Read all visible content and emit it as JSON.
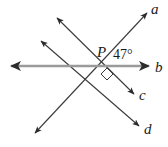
{
  "figure": {
    "background_color": "#ffffff",
    "width": 168,
    "height": 147
  },
  "point": {
    "label": "P",
    "x": 108,
    "y": 66
  },
  "angle": {
    "value": "47°",
    "degrees": 47,
    "between": [
      "a",
      "b"
    ],
    "label_x": 113,
    "label_y": 58
  },
  "right_angle": {
    "marker": "square",
    "degrees": 90,
    "x": 107,
    "y": 75
  },
  "lines": [
    {
      "id": "line-a",
      "label": "a",
      "color": "#3a3a3a",
      "stroke_width": 1.1,
      "x1": 35,
      "y1": 133,
      "x2": 147,
      "y2": 13,
      "arrow_start": true,
      "arrow_end": true,
      "label_x": 152,
      "label_y": 12
    },
    {
      "id": "line-b",
      "label": "b",
      "color": "#9a9a9a",
      "stroke_width": 2.4,
      "x1": 11,
      "y1": 66,
      "x2": 149,
      "y2": 66,
      "arrow_start": true,
      "arrow_end": true,
      "label_x": 156,
      "label_y": 71
    },
    {
      "id": "line-c",
      "label": "c",
      "color": "#3a3a3a",
      "stroke_width": 1.1,
      "x1": 57,
      "y1": 18,
      "x2": 134,
      "y2": 94,
      "arrow_start": true,
      "arrow_end": true,
      "label_x": 140,
      "label_y": 99
    },
    {
      "id": "line-d",
      "label": "d",
      "color": "#3a3a3a",
      "stroke_width": 1.1,
      "x1": 41,
      "y1": 41,
      "x2": 139,
      "y2": 126,
      "arrow_start": true,
      "arrow_end": true,
      "label_x": 145,
      "label_y": 133
    }
  ]
}
